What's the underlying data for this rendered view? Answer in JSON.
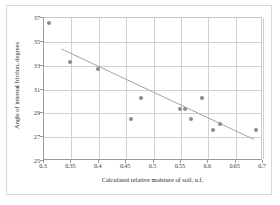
{
  "chart_data": {
    "type": "scatter",
    "title": "",
    "xlabel": "Calculated relative moisture of soil, u.f.",
    "ylabel": "Angle of internal friction, degrees",
    "xlim": [
      0.3,
      0.7
    ],
    "ylim": [
      25,
      37
    ],
    "xticks": [
      0.3,
      0.35,
      0.4,
      0.45,
      0.5,
      0.55,
      0.6,
      0.65,
      0.7
    ],
    "xtick_labels": [
      "0.3",
      "0.35",
      "0.4",
      "0.45",
      "0.5",
      "0.55",
      "0.6",
      "0.65",
      "0.7"
    ],
    "yticks": [
      25,
      27,
      29,
      31,
      33,
      35,
      37
    ],
    "ytick_labels": [
      "25",
      "27",
      "29",
      "31",
      "33",
      "35",
      "37"
    ],
    "grid": true,
    "legend": "none",
    "marker_color": "#8a8a92",
    "trendline_color": "#9a9a9a",
    "grid_color": "#d0d0d0",
    "axis_color": "#9a9a9a",
    "points": [
      {
        "x": 0.31,
        "y": 36.6
      },
      {
        "x": 0.348,
        "y": 33.3
      },
      {
        "x": 0.398,
        "y": 32.7
      },
      {
        "x": 0.458,
        "y": 28.5
      },
      {
        "x": 0.478,
        "y": 30.3
      },
      {
        "x": 0.549,
        "y": 29.35
      },
      {
        "x": 0.557,
        "y": 29.35
      },
      {
        "x": 0.569,
        "y": 28.5
      },
      {
        "x": 0.588,
        "y": 30.3
      },
      {
        "x": 0.609,
        "y": 27.6
      },
      {
        "x": 0.621,
        "y": 28.1
      },
      {
        "x": 0.688,
        "y": 27.6
      }
    ],
    "trendline": {
      "x_start": 0.332,
      "y_start": 34.4,
      "x_end": 0.684,
      "y_end": 26.8
    }
  }
}
